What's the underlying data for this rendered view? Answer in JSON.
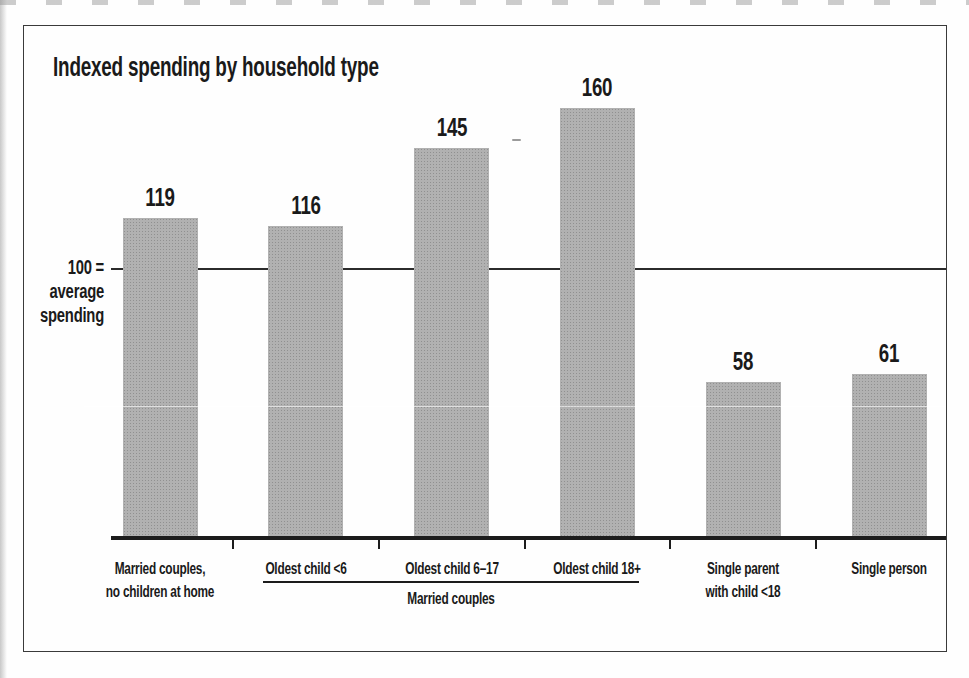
{
  "page": {
    "background_color": "#fefefe",
    "frame_border_color": "#3a3a3a",
    "text_color": "#1a1a1a"
  },
  "chart_data": {
    "type": "bar",
    "title": "Indexed spending by household type",
    "categories": [
      "Married couples,\nno children at home",
      "Oldest child <6",
      "Oldest child 6–17",
      "Oldest child 18+",
      "Single parent\nwith child <18",
      "Single person"
    ],
    "values": [
      119,
      116,
      145,
      160,
      58,
      61
    ],
    "bar_color": "#a9a9a9",
    "ylim": [
      0,
      170
    ],
    "grid": false,
    "legend": false,
    "xlabel": "",
    "ylabel": "",
    "reference_line": {
      "value": 100,
      "label": "100 =\naverage\nspending"
    },
    "group_bracket": {
      "label": "Married couples",
      "from_category_index": 1,
      "to_category_index": 3
    }
  }
}
